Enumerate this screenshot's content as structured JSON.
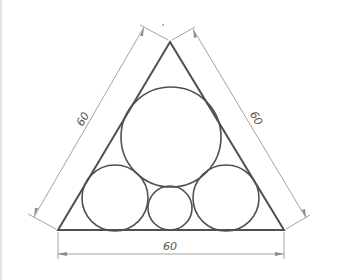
{
  "diagram": {
    "triangle": {
      "apex": [
        170,
        42
      ],
      "bottom_left": [
        58,
        230
      ],
      "bottom_right": [
        284,
        230
      ]
    },
    "circles": [
      {
        "name": "large-top-circle",
        "cx": 171,
        "cy": 137,
        "r": 50
      },
      {
        "name": "left-circle",
        "cx": 115,
        "cy": 198,
        "r": 33
      },
      {
        "name": "right-circle",
        "cx": 226,
        "cy": 198,
        "r": 33
      },
      {
        "name": "small-center-circle",
        "cx": 170,
        "cy": 208,
        "r": 22
      }
    ],
    "dimensions": {
      "left": "60",
      "right": "60",
      "bottom": "60"
    },
    "colors": {
      "stroke": "#505050",
      "dim_line": "#8a8a8a"
    }
  }
}
